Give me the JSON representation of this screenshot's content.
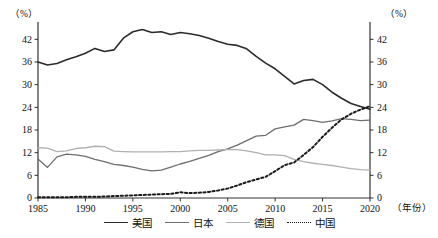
{
  "chart_data": {
    "type": "line",
    "title": "",
    "xlabel": "（年份）",
    "ylabel": "（%）",
    "unit_left": "（%）",
    "unit_right": "（%）",
    "grid": false,
    "legend_position": "bottom-center",
    "xlim": [
      1985,
      2020
    ],
    "ylim": [
      0,
      45
    ],
    "x_ticks": [
      1985,
      1990,
      1995,
      2000,
      2005,
      2010,
      2015,
      2020
    ],
    "y_ticks": [
      0,
      6,
      12,
      18,
      24,
      30,
      36,
      42
    ],
    "y_ticks_right": [
      0,
      6,
      12,
      18,
      24,
      30,
      36,
      42
    ],
    "x": [
      1985,
      1986,
      1987,
      1988,
      1989,
      1990,
      1991,
      1992,
      1993,
      1994,
      1995,
      1996,
      1997,
      1998,
      1999,
      2000,
      2001,
      2002,
      2003,
      2004,
      2005,
      2006,
      2007,
      2008,
      2009,
      2010,
      2011,
      2012,
      2013,
      2014,
      2015,
      2016,
      2017,
      2018,
      2019,
      2020
    ],
    "series": [
      {
        "name": "美国",
        "key": "usa",
        "color": "#2b2b2b",
        "style": "solid",
        "width": 1.6,
        "values": [
          36.0,
          35.2,
          35.6,
          36.6,
          37.4,
          38.3,
          39.6,
          38.8,
          39.2,
          42.3,
          44.0,
          44.6,
          43.8,
          44.0,
          43.3,
          43.8,
          43.5,
          43.0,
          42.3,
          41.4,
          40.7,
          40.4,
          39.5,
          37.5,
          35.7,
          34.2,
          32.2,
          30.2,
          31.1,
          31.4,
          30.0,
          28.0,
          26.4,
          25.0,
          24.2,
          23.5
        ]
      },
      {
        "name": "日本",
        "key": "japan",
        "color": "#6e6e6e",
        "style": "solid",
        "width": 1.3,
        "values": [
          10.3,
          8.1,
          10.9,
          11.6,
          11.4,
          11.0,
          10.2,
          9.6,
          8.9,
          8.6,
          8.2,
          7.6,
          7.2,
          7.4,
          8.2,
          9.0,
          9.7,
          10.5,
          11.3,
          12.3,
          13.0,
          14.0,
          15.2,
          16.4,
          16.6,
          18.3,
          18.8,
          19.3,
          20.8,
          20.5,
          20.0,
          20.4,
          21.0,
          20.8,
          20.5,
          20.6
        ]
      },
      {
        "name": "德国",
        "key": "germany",
        "color": "#b0b0b0",
        "style": "solid",
        "width": 1.3,
        "values": [
          13.3,
          13.2,
          12.3,
          12.5,
          13.1,
          13.3,
          13.7,
          13.6,
          12.4,
          12.3,
          12.2,
          12.2,
          12.2,
          12.2,
          12.3,
          12.3,
          12.5,
          12.6,
          12.6,
          12.7,
          12.8,
          12.8,
          12.5,
          12.0,
          11.4,
          11.4,
          11.2,
          10.2,
          9.6,
          9.2,
          8.9,
          8.6,
          8.2,
          7.8,
          7.5,
          7.4
        ]
      },
      {
        "name": "中国",
        "key": "china",
        "color": "#1a1a1a",
        "style": "dotted",
        "width": 2.0,
        "values": [
          0.2,
          0.2,
          0.2,
          0.2,
          0.3,
          0.3,
          0.3,
          0.4,
          0.5,
          0.6,
          0.7,
          0.8,
          0.9,
          1.0,
          1.1,
          1.5,
          1.3,
          1.4,
          1.6,
          2.0,
          2.5,
          3.3,
          4.2,
          4.9,
          5.6,
          7.1,
          8.7,
          9.4,
          11.4,
          13.5,
          16.2,
          18.6,
          20.8,
          22.3,
          23.4,
          24.3
        ]
      }
    ]
  },
  "legend": {
    "items": [
      {
        "label": "美国",
        "color": "#2b2b2b",
        "style": "solid"
      },
      {
        "label": "日本",
        "color": "#6e6e6e",
        "style": "solid"
      },
      {
        "label": "德国",
        "color": "#b0b0b0",
        "style": "solid"
      },
      {
        "label": "中国",
        "color": "#1a1a1a",
        "style": "dotted"
      }
    ]
  },
  "axes": {
    "unit_left": "（%）",
    "unit_right": "（%）",
    "x_title": "（年份）"
  }
}
